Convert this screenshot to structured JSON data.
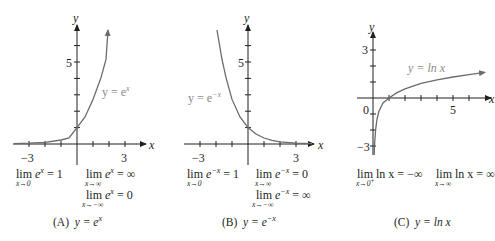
{
  "figure": {
    "colors": {
      "curve": "#6b6b6b",
      "axis": "#231f20",
      "curve_label": "#8a8a8a"
    },
    "panels": [
      {
        "id": "A",
        "caption_prefix": "(A)",
        "caption_formula": "y = e",
        "caption_exp": "x",
        "axis_x_label": "x",
        "axis_y_label": "y",
        "tick_labels": {
          "x_neg3": "−3",
          "x_3": "3",
          "y_5": "5"
        },
        "curve_label": "y = e",
        "curve_label_exp": "x",
        "limits": [
          {
            "lim": "lim",
            "expr": "e",
            "exp": "x",
            "rhs": "= 1",
            "under": "x→0"
          },
          {
            "lim": "lim",
            "expr": "e",
            "exp": "x",
            "rhs": "= ∞",
            "under": "x→∞"
          },
          {
            "lim": "lim",
            "expr": "e",
            "exp": "x",
            "rhs": "= 0",
            "under": "x→−∞"
          }
        ]
      },
      {
        "id": "B",
        "caption_prefix": "(B)",
        "caption_formula": "y = e",
        "caption_exp": "−x",
        "axis_x_label": "x",
        "axis_y_label": "y",
        "tick_labels": {
          "x_neg3": "−3",
          "x_3": "3",
          "y_5": "5"
        },
        "curve_label": "y = e",
        "curve_label_exp": "−x",
        "limits": [
          {
            "lim": "lim",
            "expr": "e",
            "exp": "−x",
            "rhs": "= 1",
            "under": "x→0"
          },
          {
            "lim": "lim",
            "expr": "e",
            "exp": "−x",
            "rhs": "= 0",
            "under": "x→∞"
          },
          {
            "lim": "lim",
            "expr": "e",
            "exp": "−x",
            "rhs": "= ∞",
            "under": "x→−∞"
          }
        ]
      },
      {
        "id": "C",
        "caption_prefix": "(C)",
        "caption_formula": "y = ln x",
        "axis_x_label": "x",
        "axis_y_label": "y",
        "tick_labels": {
          "x_0": "0",
          "x_5": "5",
          "y_3": "3",
          "y_neg3": "−3"
        },
        "curve_label": "y = ln x",
        "limits": [
          {
            "lim": "lim",
            "expr": "ln x",
            "rhs": "= −∞",
            "under": "x→0",
            "under_sup": "+"
          },
          {
            "lim": "lim",
            "expr": "ln x",
            "rhs": "= ∞",
            "under": "x→∞"
          }
        ]
      }
    ]
  }
}
